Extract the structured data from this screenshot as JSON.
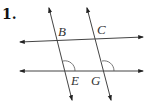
{
  "problem": {
    "number": "1."
  },
  "diagram": {
    "labels": {
      "B": "B",
      "C": "C",
      "E": "E",
      "G": "G"
    },
    "line_color": "#333333",
    "marked_angles": [
      "angle at E (upper-right)",
      "angle at G (upper-right)"
    ]
  }
}
